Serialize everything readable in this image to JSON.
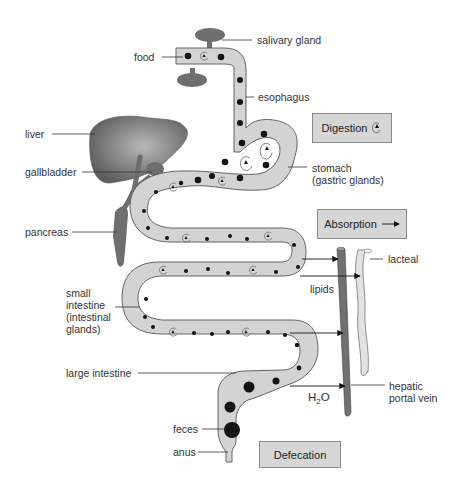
{
  "colors": {
    "tube_fill": "#d3d3d3",
    "tube_stroke": "#555555",
    "organ_fill": "#6e6e6e",
    "food_particle": "#141414",
    "portal_vein": "#707070",
    "lacteal": "#e0e0e0",
    "process_box": "#d6d6d6"
  },
  "labels": {
    "salivary_gland": "salivary gland",
    "food": "food",
    "esophagus": "esophagus",
    "liver": "liver",
    "gallbladder": "gallbladder",
    "stomach_line1": "stomach",
    "stomach_line2": "(gastric glands)",
    "pancreas": "pancreas",
    "lacteal": "lacteal",
    "small_intestine_lines": [
      "small",
      "intestine",
      "(intestinal",
      "glands)"
    ],
    "lipids": "lipids",
    "large_intestine": "large intestine",
    "h2o_main": "H",
    "h2o_sub": "2",
    "h2o_tail": "O",
    "hepatic_line1": "hepatic",
    "hepatic_line2": "portal vein",
    "feces": "feces",
    "anus": "anus"
  },
  "process_boxes": {
    "digestion": {
      "label": "Digestion",
      "icon": "enzyme-cycle-icon"
    },
    "absorption": {
      "label": "Absorption",
      "icon": "arrow-right-icon"
    },
    "defecation": {
      "label": "Defecation"
    }
  }
}
